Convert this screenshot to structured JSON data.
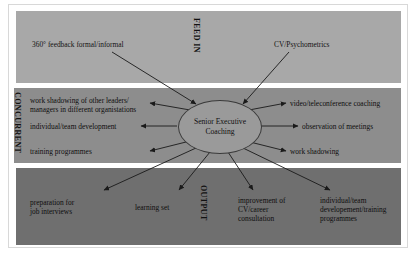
{
  "diagram": {
    "centre": {
      "label": "Senior Executive\nCoaching"
    },
    "bands": [
      {
        "id": "feed-in",
        "name": "FEED IN",
        "fill": "#a8a8a8",
        "nodes": [
          {
            "id": "feed-360",
            "label": "360° feedback formal/informal"
          },
          {
            "id": "feed-cv",
            "label": "CV/Psychometrics"
          }
        ]
      },
      {
        "id": "concurrent",
        "name": "CONCURRENT",
        "fill": "#8d8d8d",
        "nodes": [
          {
            "id": "conc-work-shadowing-leaders",
            "label": "work shadowing of other leaders/\nmanagers in different organistations"
          },
          {
            "id": "conc-individual-team-development",
            "label": "individual/team development"
          },
          {
            "id": "conc-training-programmes",
            "label": "training programmes"
          },
          {
            "id": "conc-video-coaching",
            "label": "video/teleconference coaching"
          },
          {
            "id": "conc-observation-meetings",
            "label": "observation of meetings"
          },
          {
            "id": "conc-work-shadowing",
            "label": "work shadowing"
          }
        ]
      },
      {
        "id": "output",
        "name": "OUTPUT",
        "fill": "#6f6f6f",
        "nodes": [
          {
            "id": "out-job-interviews",
            "label": "preparation for\njob interviews"
          },
          {
            "id": "out-learning-set",
            "label": "learning set"
          },
          {
            "id": "out-cv-career",
            "label": "improvement of\nCV/career\nconsultation"
          },
          {
            "id": "out-development-training",
            "label": "individual/team\ndevelopement/training\nprogrammes"
          }
        ]
      }
    ],
    "colors": {
      "feed_in_fill": "#a8a8a8",
      "concurrent_fill": "#8d8d8d",
      "output_fill": "#6f6f6f",
      "centre_fill": "#9a9a9a",
      "arrow_stroke": "#1a1a1a",
      "frame": "#d8d8d8",
      "page_background": "#ffffff"
    }
  }
}
